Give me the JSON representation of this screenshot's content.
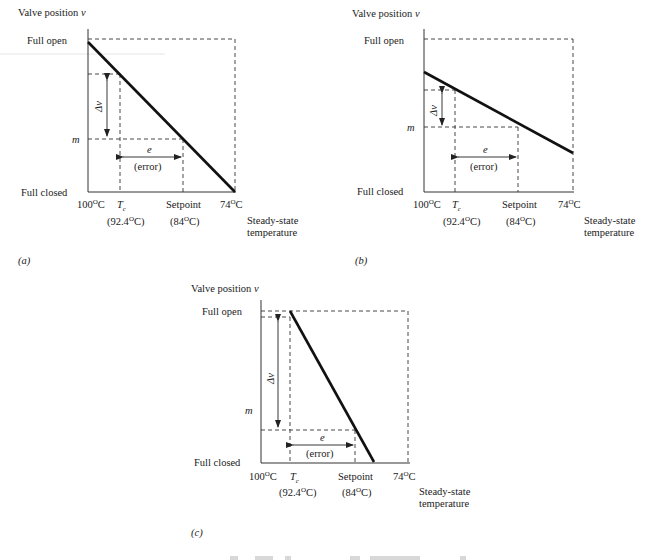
{
  "figure": {
    "panels": [
      {
        "id": "a",
        "caption": "(a)",
        "y_axis_title": "Valve position",
        "y_axis_var": "v",
        "y_labels": {
          "full_open": "Full open",
          "m": "m",
          "full_closed": "Full closed"
        },
        "x_labels": {
          "start": "100",
          "start_unit": "C",
          "tc": "T",
          "tc_sub": "c",
          "tc_value": "(92.4",
          "tc_value_unit": "C)",
          "setpoint": "Setpoint",
          "setpoint_value": "(84",
          "setpoint_value_unit": "C)",
          "end": "74",
          "end_unit": "C"
        },
        "x_axis_title_line1": "Steady-state",
        "x_axis_title_line2": "temperature",
        "delta_v": "Δv",
        "error_e": "e",
        "error_label": "(error)"
      },
      {
        "id": "b",
        "caption": "(b)",
        "y_axis_title": "Valve position",
        "y_axis_var": "v",
        "y_labels": {
          "full_open": "Full open",
          "m": "m",
          "full_closed": "Full closed"
        },
        "x_labels": {
          "start": "100",
          "start_unit": "C",
          "tc": "T",
          "tc_sub": "c",
          "tc_value": "(92.4",
          "tc_value_unit": "C)",
          "setpoint": "Setpoint",
          "setpoint_value": "(84",
          "setpoint_value_unit": "C)",
          "end": "74",
          "end_unit": "C"
        },
        "x_axis_title_line1": "Steady-state",
        "x_axis_title_line2": "temperature",
        "delta_v": "Δv",
        "error_e": "e",
        "error_label": "(error)"
      },
      {
        "id": "c",
        "caption": "(c)",
        "y_axis_title": "Valve position",
        "y_axis_var": "v",
        "y_labels": {
          "full_open": "Full open",
          "m": "m",
          "full_closed": "Full closed"
        },
        "x_labels": {
          "start": "100",
          "start_unit": "C",
          "tc": "T",
          "tc_sub": "c",
          "tc_value": "(92.4",
          "tc_value_unit": "C)",
          "setpoint": "Setpoint",
          "setpoint_value": "(84",
          "setpoint_value_unit": "C)",
          "end": "74",
          "end_unit": "C"
        },
        "x_axis_title_line1": "Steady-state",
        "x_axis_title_line2": "temperature",
        "delta_v": "Δv",
        "error_e": "e",
        "error_label": "(error)"
      }
    ],
    "degree_symbol": "O"
  }
}
